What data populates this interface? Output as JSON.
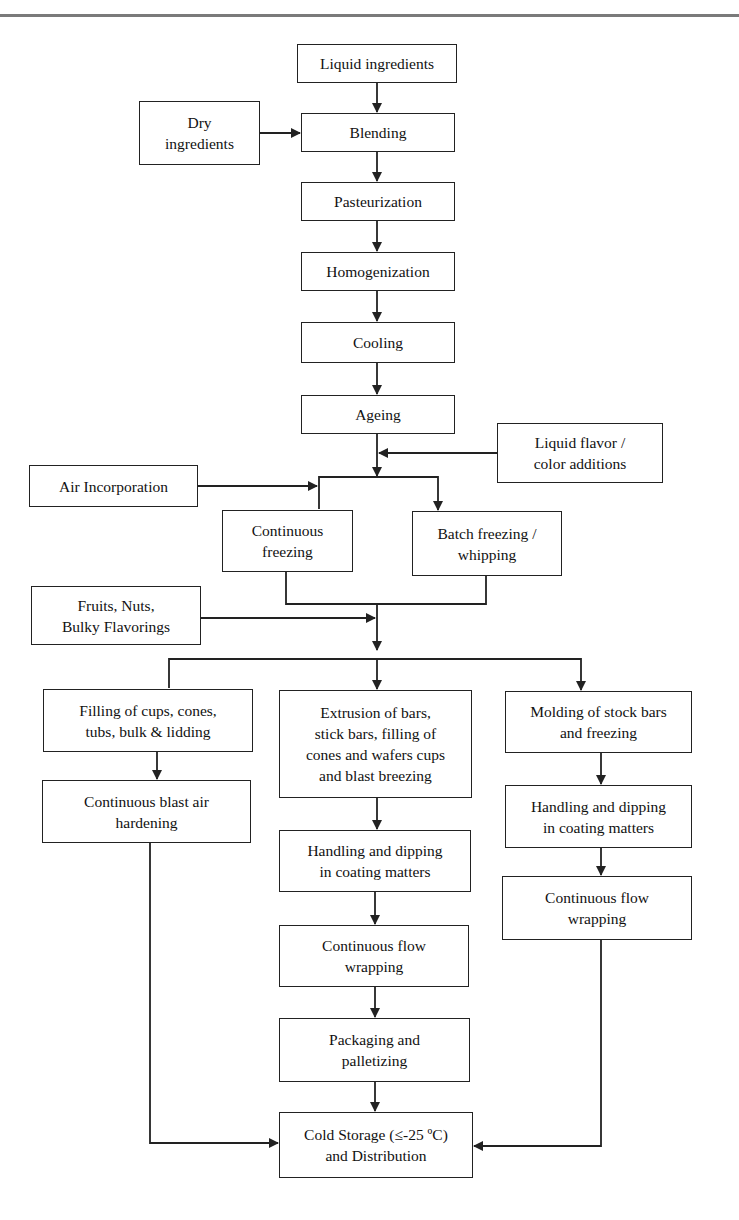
{
  "diagram": {
    "type": "flowchart",
    "nodes": [
      {
        "id": "liquid_ingredients",
        "label": "Liquid ingredients",
        "box": [
          297,
          44,
          160,
          39
        ]
      },
      {
        "id": "dry_ingredients",
        "label": "Dry\ningredients",
        "box": [
          139,
          101,
          121,
          64
        ]
      },
      {
        "id": "blending",
        "label": "Blending",
        "box": [
          301,
          113,
          154,
          39
        ]
      },
      {
        "id": "pasteurization",
        "label": "Pasteurization",
        "box": [
          301,
          182,
          154,
          39
        ]
      },
      {
        "id": "homogenization",
        "label": "Homogenization",
        "box": [
          301,
          252,
          154,
          39
        ]
      },
      {
        "id": "cooling",
        "label": "Cooling",
        "box": [
          301,
          322,
          154,
          41
        ]
      },
      {
        "id": "ageing",
        "label": "Ageing",
        "box": [
          301,
          395,
          154,
          39
        ]
      },
      {
        "id": "liquid_flavor",
        "label": "Liquid flavor /\ncolor additions",
        "box": [
          497,
          423,
          166,
          60
        ]
      },
      {
        "id": "air_incorporation",
        "label": "Air Incorporation",
        "box": [
          29,
          465,
          169,
          42
        ]
      },
      {
        "id": "continuous_freezing",
        "label": "Continuous\nfreezing",
        "box": [
          222,
          510,
          131,
          62
        ]
      },
      {
        "id": "batch_freezing",
        "label": "Batch freezing /\nwhipping",
        "box": [
          412,
          511,
          150,
          65
        ]
      },
      {
        "id": "fruits_nuts",
        "label": "Fruits, Nuts,\nBulky Flavorings",
        "box": [
          31,
          586,
          170,
          59
        ]
      },
      {
        "id": "filling",
        "label": "Filling of cups, cones,\ntubs, bulk & lidding",
        "box": [
          43,
          689,
          210,
          63
        ]
      },
      {
        "id": "extrusion",
        "label": "Extrusion of bars,\nstick bars, filling of\ncones and wafers cups\nand blast breezing",
        "box": [
          279,
          690,
          193,
          108
        ]
      },
      {
        "id": "molding",
        "label": "Molding of stock bars\nand freezing",
        "box": [
          505,
          691,
          187,
          62
        ]
      },
      {
        "id": "blast_hardening",
        "label": "Continuous blast air\nhardening",
        "box": [
          42,
          780,
          209,
          63
        ]
      },
      {
        "id": "handling_right",
        "label": "Handling and dipping\nin coating matters",
        "box": [
          505,
          785,
          187,
          63
        ]
      },
      {
        "id": "handling_mid",
        "label": "Handling and dipping\nin coating matters",
        "box": [
          279,
          830,
          192,
          62
        ]
      },
      {
        "id": "flow_wrapping_right",
        "label": "Continuous flow\nwrapping",
        "box": [
          502,
          876,
          190,
          64
        ]
      },
      {
        "id": "flow_wrapping_mid",
        "label": "Continuous flow\nwrapping",
        "box": [
          279,
          925,
          190,
          62
        ]
      },
      {
        "id": "packaging",
        "label": "Packaging and\npalletizing",
        "box": [
          279,
          1018,
          191,
          64
        ]
      },
      {
        "id": "cold_storage",
        "label": "Cold Storage (≤-25 ºC)\nand Distribution",
        "box": [
          279,
          1112,
          194,
          66
        ]
      }
    ],
    "edges": [
      {
        "from": "liquid_ingredients",
        "to": "blending"
      },
      {
        "from": "dry_ingredients",
        "to": "blending"
      },
      {
        "from": "blending",
        "to": "pasteurization"
      },
      {
        "from": "pasteurization",
        "to": "homogenization"
      },
      {
        "from": "homogenization",
        "to": "cooling"
      },
      {
        "from": "cooling",
        "to": "ageing"
      },
      {
        "from": "liquid_flavor",
        "to": "ageing_output"
      },
      {
        "from": "ageing",
        "to": "continuous_freezing"
      },
      {
        "from": "ageing",
        "to": "batch_freezing"
      },
      {
        "from": "air_incorporation",
        "to": "continuous_freezing"
      },
      {
        "from": "continuous_freezing",
        "to": "merge"
      },
      {
        "from": "batch_freezing",
        "to": "merge"
      },
      {
        "from": "fruits_nuts",
        "to": "merge"
      },
      {
        "from": "merge",
        "to": "filling"
      },
      {
        "from": "merge",
        "to": "extrusion"
      },
      {
        "from": "merge",
        "to": "molding"
      },
      {
        "from": "filling",
        "to": "blast_hardening"
      },
      {
        "from": "blast_hardening",
        "to": "cold_storage"
      },
      {
        "from": "extrusion",
        "to": "handling_mid"
      },
      {
        "from": "handling_mid",
        "to": "flow_wrapping_mid"
      },
      {
        "from": "flow_wrapping_mid",
        "to": "packaging"
      },
      {
        "from": "packaging",
        "to": "cold_storage"
      },
      {
        "from": "molding",
        "to": "handling_right"
      },
      {
        "from": "handling_right",
        "to": "flow_wrapping_right"
      },
      {
        "from": "flow_wrapping_right",
        "to": "cold_storage"
      }
    ],
    "colors": {
      "line": "#222222",
      "box_fill": "#ffffff",
      "rule": "#7a7a7a"
    }
  }
}
